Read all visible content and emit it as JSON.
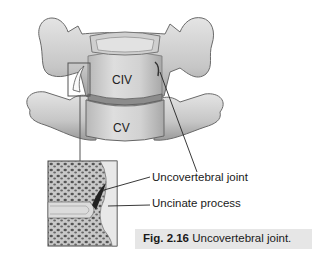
{
  "figure": {
    "vertebra_labels": {
      "upper": "CIV",
      "lower": "CV"
    },
    "callouts": [
      {
        "label": "Uncovertebral joint"
      },
      {
        "label": "Uncinate process"
      }
    ],
    "caption": {
      "number": "Fig. 2.16",
      "title": "Uncovertebral joint."
    }
  },
  "colors": {
    "bone_light": "#d9d9d9",
    "bone_mid": "#b3b3b3",
    "bone_dark": "#7a7a7a",
    "outline": "#555555",
    "caption_bg": "#e6e6e6",
    "leader_line": "#222222"
  }
}
